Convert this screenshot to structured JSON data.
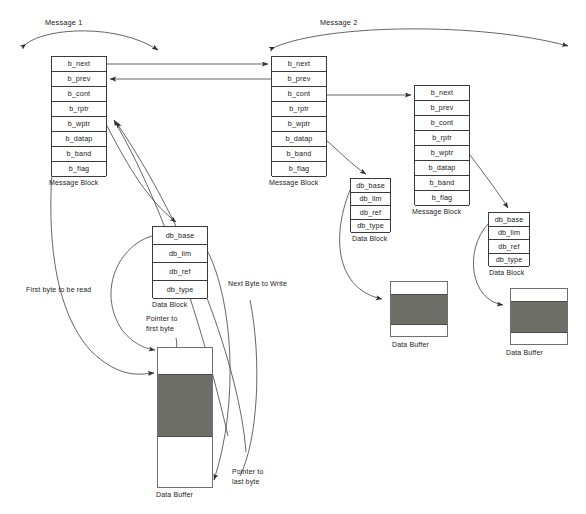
{
  "diagram": {
    "message_block_fields": [
      "b_next",
      "b_prev",
      "b_cont",
      "b_rptr",
      "b_wptr",
      "b_datap",
      "b_band",
      "b_flag"
    ],
    "data_block_fields": [
      "db_base",
      "db_lim",
      "db_ref",
      "db_type"
    ],
    "labels": {
      "message_block": "Message Block",
      "data_block": "Data Block",
      "data_buffer": "Data Buffer"
    },
    "messages": [
      {
        "id": "message-1",
        "label": "Message 1"
      },
      {
        "id": "message-2",
        "label": "Message 2"
      }
    ],
    "annotations": [
      {
        "id": "first-byte-to-be-read",
        "text": "First byte to be read"
      },
      {
        "id": "next-byte-to-write",
        "text": "Next Byte to Write"
      },
      {
        "id": "pointer-to-first-byte",
        "line1": "Pointer to",
        "line2": "first byte"
      },
      {
        "id": "pointer-to-last-byte",
        "line1": "Pointer to",
        "line2": "last byte"
      }
    ],
    "colors": {
      "stroke": "#3a3a3a",
      "buffer_fill": "#6e6e68",
      "text": "#1a1a1a",
      "background": "#ffffff"
    }
  }
}
